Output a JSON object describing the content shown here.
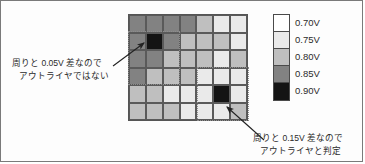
{
  "figure": {
    "title": "",
    "legend": {
      "entries": [
        {
          "label": "0.70V",
          "color": "#ffffff",
          "value": 0.7
        },
        {
          "label": "0.75V",
          "color": "#eaeaea",
          "value": 0.75
        },
        {
          "label": "0.80V",
          "color": "#bfbfbf",
          "value": 0.8
        },
        {
          "label": "0.85V",
          "color": "#828282",
          "value": 0.85
        },
        {
          "label": "0.90V",
          "color": "#141414",
          "value": 0.9
        }
      ]
    },
    "annotations": {
      "non_outlier": {
        "line1": "周りと 0.05V 差なので",
        "line2": "アウトライヤではない"
      },
      "outlier": {
        "line1": "周りと 0.15V 差なので",
        "line2": "アウトライヤと判定"
      }
    }
  },
  "chart_data": {
    "type": "heatmap",
    "title": "",
    "xlabel": "",
    "ylabel": "",
    "unit": "V",
    "rows": 6,
    "cols": 7,
    "colorscale": [
      {
        "value": 0.7,
        "color": "#ffffff"
      },
      {
        "value": 0.75,
        "color": "#eaeaea"
      },
      {
        "value": 0.8,
        "color": "#bfbfbf"
      },
      {
        "value": 0.85,
        "color": "#828282"
      },
      {
        "value": 0.9,
        "color": "#141414"
      }
    ],
    "values": [
      [
        0.85,
        0.85,
        0.85,
        0.85,
        0.8,
        0.75,
        0.75
      ],
      [
        0.85,
        0.9,
        0.85,
        0.8,
        0.8,
        0.8,
        0.75
      ],
      [
        0.85,
        0.85,
        0.8,
        0.8,
        0.8,
        0.75,
        0.8
      ],
      [
        0.85,
        0.8,
        0.8,
        0.8,
        0.75,
        0.75,
        0.75
      ],
      [
        0.8,
        0.8,
        0.75,
        0.75,
        0.75,
        0.9,
        0.75
      ],
      [
        0.8,
        0.8,
        0.8,
        0.75,
        0.75,
        0.75,
        0.8
      ]
    ],
    "highlights": [
      {
        "name": "non-outlier",
        "row": 2,
        "col": 2,
        "value": 0.9,
        "neighborhood": "3x3"
      },
      {
        "name": "outlier",
        "row": 5,
        "col": 6,
        "value": 0.9,
        "neighborhood": "3x3"
      }
    ]
  }
}
